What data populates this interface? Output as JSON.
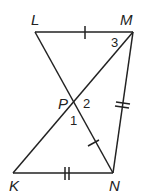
{
  "diagram": {
    "points": {
      "L": {
        "label": "L",
        "x": 35,
        "y": 32
      },
      "M": {
        "label": "M",
        "x": 133,
        "y": 32
      },
      "P": {
        "label": "P",
        "x": 76,
        "y": 103
      },
      "K": {
        "label": "K",
        "x": 13,
        "y": 173
      },
      "N": {
        "label": "N",
        "x": 113,
        "y": 173
      }
    },
    "angles": {
      "a1": "1",
      "a2": "2",
      "a3": "3"
    },
    "segments": [
      "LM",
      "LN",
      "MK",
      "MN",
      "KN"
    ],
    "congruence": {
      "single_tick": [
        "LM",
        "PN"
      ],
      "double_tick": [
        "MN",
        "KN"
      ]
    },
    "line_color": "#222222"
  }
}
